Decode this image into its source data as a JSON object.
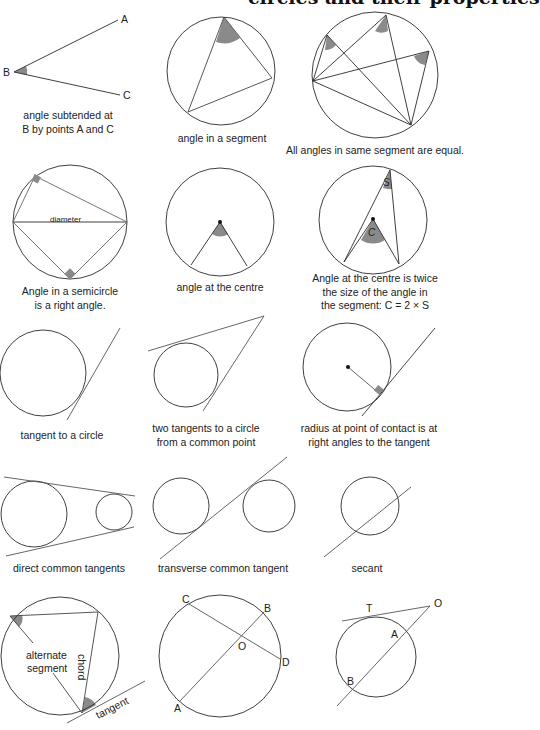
{
  "page": {
    "title": "circles and their properties"
  },
  "diagrams": [
    {
      "id": "angle-subtended",
      "caption_lines": [
        "angle subtended at",
        "B by points A and C"
      ],
      "point_labels": {
        "A": "A",
        "B": "B",
        "C": "C"
      }
    },
    {
      "id": "angle-in-segment",
      "caption_lines": [
        "angle in a segment"
      ]
    },
    {
      "id": "angles-same-segment",
      "caption_lines": [
        "All angles in same segment are equal."
      ]
    },
    {
      "id": "angle-in-semicircle",
      "caption_lines": [
        "Angle in a semicircle",
        "is a right angle."
      ],
      "inner_label": "diameter"
    },
    {
      "id": "angle-at-centre",
      "caption_lines": [
        "angle at the centre"
      ]
    },
    {
      "id": "centre-twice-segment",
      "caption_lines": [
        "Angle at the centre is twice",
        "the size of the angle in",
        "the segment: C = 2 × S"
      ],
      "angle_labels": {
        "centre": "C",
        "segment": "S"
      }
    },
    {
      "id": "tangent-to-circle",
      "caption_lines": [
        "tangent to a circle"
      ]
    },
    {
      "id": "two-tangents",
      "caption_lines": [
        "two tangents to a circle",
        "from a common point"
      ]
    },
    {
      "id": "radius-tangent",
      "caption_lines": [
        "radius at point of contact is at",
        "right angles to the tangent"
      ]
    },
    {
      "id": "direct-common-tangents",
      "caption_lines": [
        "direct common tangents"
      ]
    },
    {
      "id": "transverse-common-tangent",
      "caption_lines": [
        "transverse common tangent"
      ]
    },
    {
      "id": "secant",
      "caption_lines": [
        "secant"
      ]
    },
    {
      "id": "alternate-segment",
      "caption_lines": [],
      "inner_labels": {
        "segment_line1": "alternate",
        "segment_line2": "segment",
        "chord": "chord",
        "tangent": "tangent"
      }
    },
    {
      "id": "intersecting-chords",
      "caption_lines": [],
      "point_labels": {
        "A": "A",
        "B": "B",
        "C": "C",
        "D": "D",
        "O": "O"
      }
    },
    {
      "id": "tangent-secant",
      "caption_lines": [],
      "point_labels": {
        "T": "T",
        "O": "O",
        "A": "A",
        "B": "B"
      }
    }
  ],
  "colors": {
    "stroke": "#2a2a2a",
    "stroke_light": "#5a5a5a",
    "shade": "#8a8a8a",
    "background": "#ffffff"
  }
}
